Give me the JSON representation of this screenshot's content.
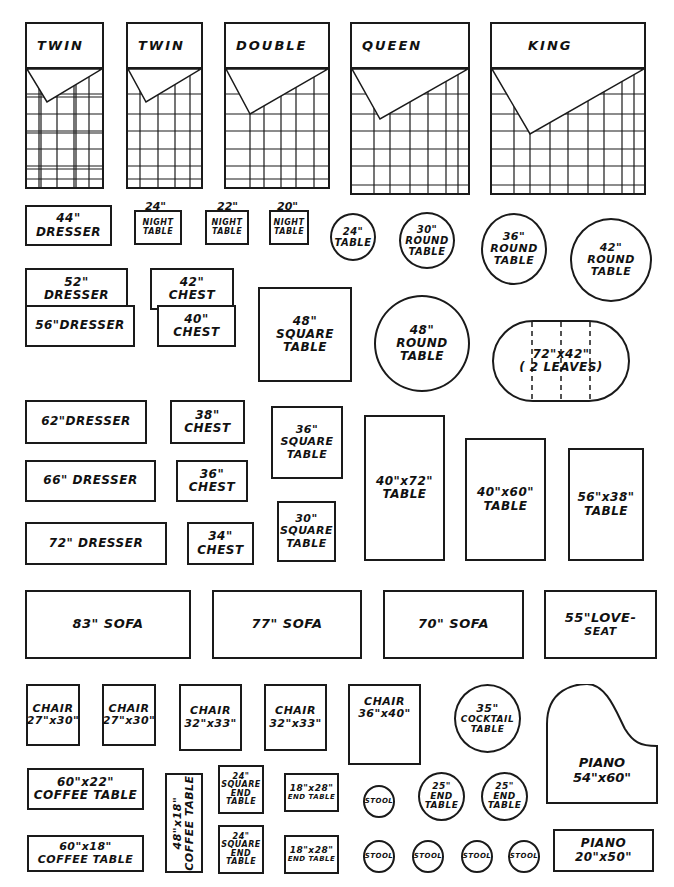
{
  "beds": [
    {
      "label": "TWIN"
    },
    {
      "label": "TWIN"
    },
    {
      "label": "DOUBLE"
    },
    {
      "label": "QUEEN"
    },
    {
      "label": "KING"
    }
  ],
  "dressers": {
    "d44": {
      "size": "44\"",
      "name": "DRESSER"
    },
    "d52": {
      "size": "52\"",
      "name": "DRESSER"
    },
    "d56": {
      "label": "56\"DRESSER"
    },
    "d62": {
      "label": "62\"DRESSER"
    },
    "d66": {
      "label": "66\" DRESSER"
    },
    "d72": {
      "label": "72\" DRESSER"
    }
  },
  "night_tables": [
    {
      "size": "24\"",
      "line1": "NIGHT",
      "line2": "TABLE"
    },
    {
      "size": "22\"",
      "line1": "NIGHT",
      "line2": "TABLE"
    },
    {
      "size": "20\"",
      "line1": "NIGHT",
      "line2": "TABLE"
    }
  ],
  "chests": [
    {
      "size": "42\"",
      "name": "CHEST"
    },
    {
      "size": "40\"",
      "name": "CHEST"
    },
    {
      "size": "38\"",
      "name": "CHEST"
    },
    {
      "size": "36\"",
      "name": "CHEST"
    },
    {
      "size": "34\"",
      "name": "CHEST"
    }
  ],
  "round_tables": [
    {
      "size": "24\"",
      "name": "TABLE"
    },
    {
      "size": "30\"",
      "name": "ROUND",
      "name2": "TABLE"
    },
    {
      "size": "36\"",
      "name": "ROUND",
      "name2": "TABLE"
    },
    {
      "size": "42\"",
      "name": "ROUND",
      "name2": "TABLE"
    },
    {
      "size": "48\"",
      "name": "ROUND",
      "name2": "TABLE"
    }
  ],
  "square_tables": [
    {
      "size": "48\"",
      "name": "SQUARE",
      "name2": "TABLE"
    },
    {
      "size": "36\"",
      "name": "SQUARE",
      "name2": "TABLE"
    },
    {
      "size": "30\"",
      "name": "SQUARE",
      "name2": "TABLE"
    }
  ],
  "oval_table": {
    "size": "72\"x42\"",
    "note": "( 2 LEAVES)"
  },
  "rect_tables": [
    {
      "size": "40\"x72\"",
      "name": "TABLE"
    },
    {
      "size": "40\"x60\"",
      "name": "TABLE"
    },
    {
      "size": "56\"x38\"",
      "name": "TABLE"
    }
  ],
  "sofas": [
    {
      "label": "83\" SOFA"
    },
    {
      "label": "77\" SOFA"
    },
    {
      "label": "70\" SOFA"
    },
    {
      "line1": "55\"LOVE-",
      "line2": "SEAT"
    }
  ],
  "chairs": [
    {
      "name": "CHAIR",
      "size": "27\"x30\""
    },
    {
      "name": "CHAIR",
      "size": "27\"x30\""
    },
    {
      "name": "CHAIR",
      "size": "32\"x33\""
    },
    {
      "name": "CHAIR",
      "size": "32\"x33\""
    },
    {
      "name": "CHAIR",
      "size": "36\"x40\""
    }
  ],
  "cocktail_table": {
    "size": "35\"",
    "name": "COCKTAIL",
    "name2": "TABLE"
  },
  "pianos": [
    {
      "name": "PIANO",
      "size": "54\"x60\""
    },
    {
      "name": "PIANO",
      "size": "20\"x50\""
    }
  ],
  "coffee_tables": [
    {
      "size": "60\"x22\"",
      "name": "COFFEE TABLE"
    },
    {
      "size": "60\"x18\"",
      "name": "COFFEE TABLE"
    },
    {
      "size": "48\"x18\"",
      "name": "COFFEE TABLE"
    }
  ],
  "square_end_tables": [
    {
      "size": "24\"",
      "l1": "SQUARE",
      "l2": "END",
      "l3": "TABLE"
    },
    {
      "size": "24\"",
      "l1": "SQUARE",
      "l2": "END",
      "l3": "TABLE"
    }
  ],
  "end_tables": [
    {
      "size": "18\"x28\"",
      "name": "END TABLE"
    },
    {
      "size": "18\"x28\"",
      "name": "END TABLE"
    }
  ],
  "round_end_tables": [
    {
      "size": "25\"",
      "l1": "END",
      "l2": "TABLE"
    },
    {
      "size": "25\"",
      "l1": "END",
      "l2": "TABLE"
    }
  ],
  "stools": [
    {
      "label": "STOOL"
    },
    {
      "label": "STOOL"
    },
    {
      "label": "STOOL"
    },
    {
      "label": "STOOL"
    },
    {
      "label": "STOOL"
    }
  ],
  "colors": {
    "ink": "#1a1a1a",
    "paper": "#ffffff"
  }
}
